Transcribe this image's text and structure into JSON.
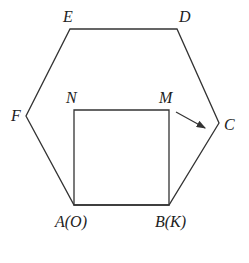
{
  "diagram": {
    "hexagon": {
      "vertices": [
        {
          "name": "A",
          "x": 74,
          "y": 205
        },
        {
          "name": "B",
          "x": 169,
          "y": 205
        },
        {
          "name": "C",
          "x": 219,
          "y": 123
        },
        {
          "name": "D",
          "x": 177,
          "y": 29
        },
        {
          "name": "E",
          "x": 70,
          "y": 29
        },
        {
          "name": "F",
          "x": 26,
          "y": 116
        }
      ]
    },
    "square": {
      "vertices": [
        {
          "name": "A",
          "x": 74,
          "y": 205
        },
        {
          "name": "B",
          "x": 169,
          "y": 205
        },
        {
          "name": "M",
          "x": 169,
          "y": 110
        },
        {
          "name": "N",
          "x": 74,
          "y": 110
        }
      ]
    },
    "arrow": {
      "from": "M",
      "to": "C",
      "x1": 176,
      "y1": 112,
      "x2": 205,
      "y2": 128
    },
    "labels": {
      "A": "A(O)",
      "B": "B(K)",
      "C": "C",
      "D": "D",
      "E": "E",
      "F": "F",
      "M": "M",
      "N": "N"
    },
    "colors": {
      "stroke": "#333333",
      "background": "#ffffff"
    }
  }
}
